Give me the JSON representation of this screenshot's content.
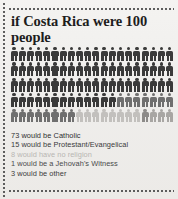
{
  "poster": {
    "title": "if Costa Rica were 100 people",
    "background_color": "#f1efed"
  },
  "chart_data": {
    "type": "pictogram",
    "title": "if Costa Rica were 100 people",
    "unit": "person icon = 1 person",
    "total": 100,
    "columns_per_row": 20,
    "rows": 5,
    "categories": [
      {
        "label": "73 would be Catholic",
        "name": "Catholic",
        "value": 73,
        "color": "#3a3a3a"
      },
      {
        "label": "15 would be Protestant/Evangelical",
        "name": "Protestant/Evangelical",
        "value": 15,
        "color": "#6f6f6f"
      },
      {
        "label": "8 would have no religion",
        "name": "No religion",
        "value": 8,
        "color": "#c2c0bd"
      },
      {
        "label": "1 would be a Jehovah's Witness",
        "name": "Jehovah's Witness",
        "value": 1,
        "color": "#8d8b89"
      },
      {
        "label": "3 would be other",
        "name": "Other",
        "value": 3,
        "color": "#a8a6a3"
      }
    ],
    "legend_position": "below",
    "grid": false
  },
  "legend": {
    "lines": [
      "73 would be Catholic",
      "15 would be Protestant/Evangelical",
      "8 would have no religion",
      "1 would be a Jehovah's Witness",
      "3 would be other"
    ],
    "colors": [
      "#2f2f2f",
      "#3a3a3a",
      "#b8b6b3",
      "#4a4a4a",
      "#3a3a3a"
    ]
  }
}
